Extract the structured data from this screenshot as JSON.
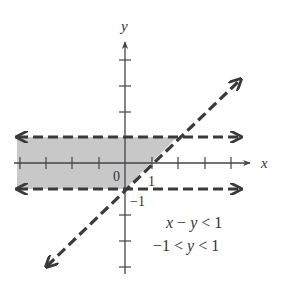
{
  "graph": {
    "axes": {
      "x_label": "x",
      "y_label": "y",
      "origin_label": "0",
      "x_tick_label": "1",
      "y_tick_label": "−1"
    },
    "inequalities": [
      {
        "text_parts": [
          "x",
          " − ",
          "y",
          " < 1"
        ],
        "expr": "x − y < 1"
      },
      {
        "text_parts": [
          "−1 < ",
          "y",
          " < 1"
        ],
        "expr": "−1 < y < 1"
      }
    ],
    "boundaries": [
      {
        "equation": "y = 1",
        "style": "dashed"
      },
      {
        "equation": "y = -1",
        "style": "dashed"
      },
      {
        "equation": "y = x - 1",
        "style": "dashed"
      }
    ],
    "shaded_region": "−1 < y < 1 and y > x − 1",
    "colors": {
      "shade": "#c8c8c8",
      "line": "#3a3a3a",
      "axis": "#444444"
    }
  }
}
